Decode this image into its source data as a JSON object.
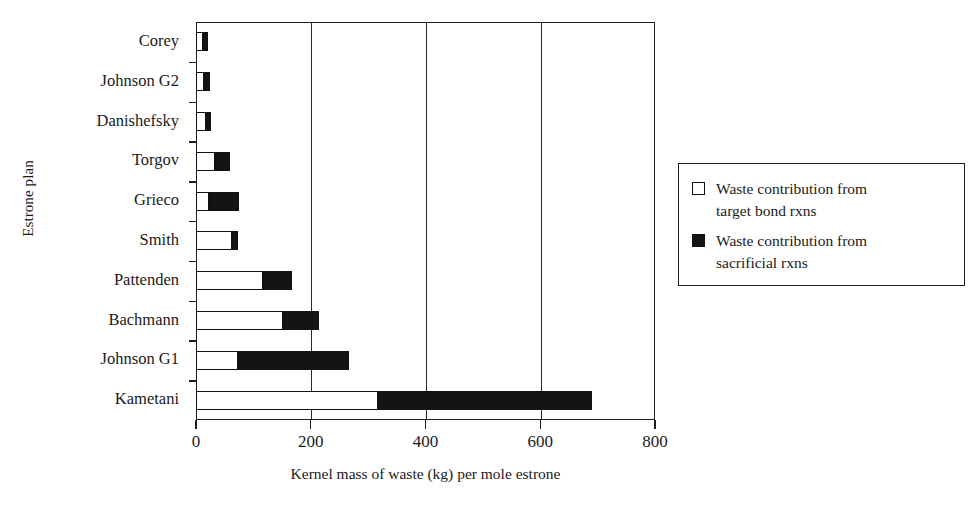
{
  "chart_data": {
    "type": "bar",
    "orientation": "horizontal",
    "stacked": true,
    "title": "",
    "xlabel": "Kernel mass of waste (kg) per mole estrone",
    "ylabel": "Estrone plan",
    "xlim": [
      0,
      800
    ],
    "xticks": [
      0,
      200,
      400,
      600,
      800
    ],
    "xtick_labels": [
      "0",
      "200",
      "400",
      "600",
      "800"
    ],
    "grid": "vertical gridlines at x ticks",
    "legend_position": "right, outside plot area",
    "categories": [
      "Corey",
      "Johnson G2",
      "Danishefsky",
      "Torgov",
      "Grieco",
      "Smith",
      "Pattenden",
      "Bachmann",
      "Johnson G1",
      "Kametani"
    ],
    "series": [
      {
        "name": "Waste contribution from target bond rxns",
        "swatch": "white",
        "values": [
          12,
          14,
          18,
          33,
          23,
          63,
          117,
          152,
          73,
          317
        ]
      },
      {
        "name": "Waste contribution from sacrificial rxns",
        "swatch": "black",
        "values": [
          3,
          11,
          2,
          26,
          52,
          10,
          50,
          62,
          194,
          373
        ]
      }
    ],
    "totals": [
      15,
      25,
      20,
      59,
      75,
      73,
      167,
      214,
      267,
      690
    ]
  },
  "axes": {
    "y_title": "Estrone plan",
    "x_title": "Kernel mass of waste (kg) per mole estrone",
    "x_tick_labels": [
      "0",
      "200",
      "400",
      "600",
      "800"
    ],
    "category_labels": [
      "Corey",
      "Johnson G2",
      "Danishefsky",
      "Torgov",
      "Grieco",
      "Smith",
      "Pattenden",
      "Bachmann",
      "Johnson G1",
      "Kametani"
    ]
  },
  "legend": {
    "items": [
      {
        "label": "Waste contribution from\ntarget bond rxns",
        "swatch": "white"
      },
      {
        "label": "Waste contribution from\nsacrificial rxns",
        "swatch": "black"
      }
    ]
  },
  "colors": {
    "bar_white": "#ffffff",
    "bar_black": "#141414",
    "axis": "#1d1d1d",
    "text": "#1a1a1a",
    "background": "#ffffff"
  }
}
